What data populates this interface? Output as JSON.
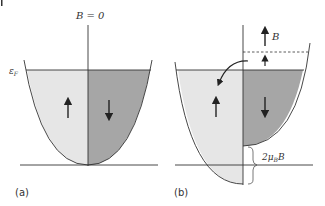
{
  "figure": {
    "panel_a": {
      "label": "(a)",
      "field_label": "B = 0",
      "fermi_label": "εF",
      "fermi_label_main": "ε",
      "fermi_label_sub": "F",
      "up_spin": "↑",
      "down_spin": "↓"
    },
    "panel_b": {
      "label": "(b)",
      "field_label": "B",
      "splitting_label": "2μBB",
      "splitting_main": "2μ",
      "splitting_sub": "B",
      "splitting_tail": "B",
      "up_spin": "↑",
      "down_spin": "↓"
    },
    "colors": {
      "up_fill": "#e6e6e6",
      "down_fill": "#a6a6a6",
      "line": "#333333"
    }
  }
}
